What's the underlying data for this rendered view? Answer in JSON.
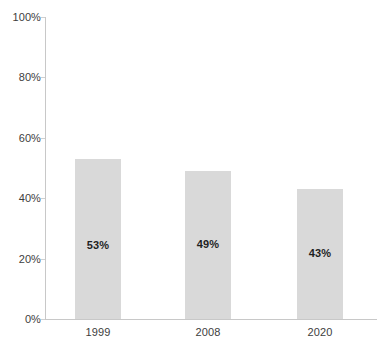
{
  "chart_data": {
    "type": "bar",
    "title": "",
    "subtitle": "",
    "xlabel": "",
    "ylabel": "",
    "categories": [
      "1999",
      "2008",
      "2020"
    ],
    "values": [
      53,
      49,
      43
    ],
    "value_labels": [
      "53%",
      "49%",
      "43%"
    ],
    "ylim": [
      0,
      100
    ],
    "y_ticks": [
      0,
      20,
      40,
      60,
      80,
      100
    ],
    "y_tick_labels": [
      "0%",
      "20%",
      "40%",
      "60%",
      "80%",
      "100%"
    ],
    "grid": false,
    "legend": null,
    "series": [
      {
        "name": "",
        "values": [
          53,
          49,
          43
        ]
      }
    ],
    "colors": {
      "bar_fill": "#d9d9d9",
      "axis_line": "#c8c8c8",
      "tick_text": "#3d3d3d",
      "value_text": "#1f1f1f",
      "background": "#ffffff"
    }
  }
}
